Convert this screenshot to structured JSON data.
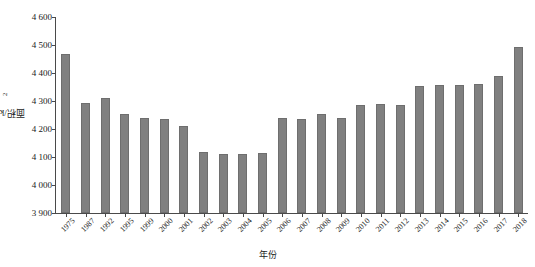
{
  "chart_data": {
    "type": "bar",
    "title": "",
    "xlabel": "年份",
    "ylabel": "面积/km²",
    "ylabel_base": "面积/km",
    "ylabel_sup": "2",
    "ylim": [
      3900,
      4600
    ],
    "yticks": [
      3900,
      4000,
      4100,
      4200,
      4300,
      4400,
      4500,
      4600
    ],
    "ytick_labels": [
      "3 900",
      "4 000",
      "4 100",
      "4 200",
      "4 300",
      "4 400",
      "4 500",
      "4 600"
    ],
    "grid": false,
    "legend": false,
    "bar_color": "#808080",
    "axis_color": "#4a4a4a",
    "categories": [
      "1975",
      "1987",
      "1992",
      "1995",
      "1999",
      "2000",
      "2001",
      "2002",
      "2003",
      "2004",
      "2005",
      "2006",
      "2007",
      "2008",
      "2009",
      "2010",
      "2011",
      "2012",
      "2013",
      "2014",
      "2015",
      "2016",
      "2017",
      "2018"
    ],
    "values": [
      4467,
      4292,
      4309,
      4255,
      4241,
      4237,
      4212,
      4118,
      4111,
      4112,
      4113,
      4239,
      4236,
      4255,
      4240,
      4286,
      4289,
      4287,
      4355,
      4357,
      4358,
      4361,
      4391,
      4494
    ]
  }
}
